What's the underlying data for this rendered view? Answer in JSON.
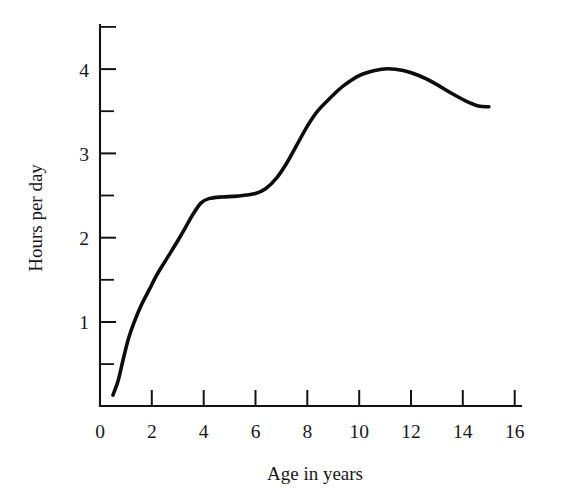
{
  "chart_data": {
    "type": "line",
    "title": "",
    "subtitle": "",
    "xlabel": "Age in years",
    "ylabel": "Hours per day",
    "xlim": [
      0,
      16.2
    ],
    "ylim": [
      0,
      4.52
    ],
    "grid": false,
    "legend": false,
    "legend_position": "none",
    "x_ticks_major": [
      0,
      2,
      4,
      6,
      8,
      10,
      12,
      14,
      16
    ],
    "x_tick_labels": [
      "0",
      "2",
      "4",
      "6",
      "8",
      "10",
      "12",
      "14",
      "16"
    ],
    "y_ticks_major": [
      1,
      2,
      3,
      4
    ],
    "y_tick_labels": [
      "1",
      "2",
      "3",
      "4"
    ],
    "y_ticks_minor": [
      0.5,
      1.5,
      2.5,
      3.5,
      4.5
    ],
    "series": [
      {
        "name": "Hours per day",
        "color": "#0d0d0d",
        "x": [
          0.5,
          0.7,
          0.9,
          1.1,
          1.3,
          1.6,
          1.9,
          2.2,
          2.6,
          3.0,
          3.3,
          3.6,
          3.9,
          4.2,
          4.7,
          5.3,
          6.0,
          6.4,
          6.8,
          7.2,
          7.6,
          8.0,
          8.4,
          8.9,
          9.4,
          10.0,
          10.6,
          11.1,
          11.7,
          12.3,
          12.9,
          13.5,
          14.1,
          14.6,
          15.0
        ],
        "y": [
          0.13,
          0.3,
          0.56,
          0.8,
          0.98,
          1.2,
          1.38,
          1.56,
          1.76,
          1.96,
          2.12,
          2.28,
          2.41,
          2.46,
          2.48,
          2.49,
          2.52,
          2.58,
          2.7,
          2.88,
          3.1,
          3.32,
          3.5,
          3.66,
          3.8,
          3.92,
          3.98,
          4.0,
          3.98,
          3.92,
          3.83,
          3.72,
          3.62,
          3.56,
          3.55
        ]
      }
    ],
    "annotations": []
  },
  "axis_titles": {
    "x": "Age in years",
    "y": "Hours per day"
  },
  "x_tick_labels": [
    "0",
    "2",
    "4",
    "6",
    "8",
    "10",
    "12",
    "14",
    "16"
  ],
  "y_tick_labels": [
    "1",
    "2",
    "3",
    "4"
  ],
  "colors": {
    "curve": "#0d0d0d",
    "axis": "#121212",
    "text": "#17161a",
    "background": "#ffffff"
  }
}
